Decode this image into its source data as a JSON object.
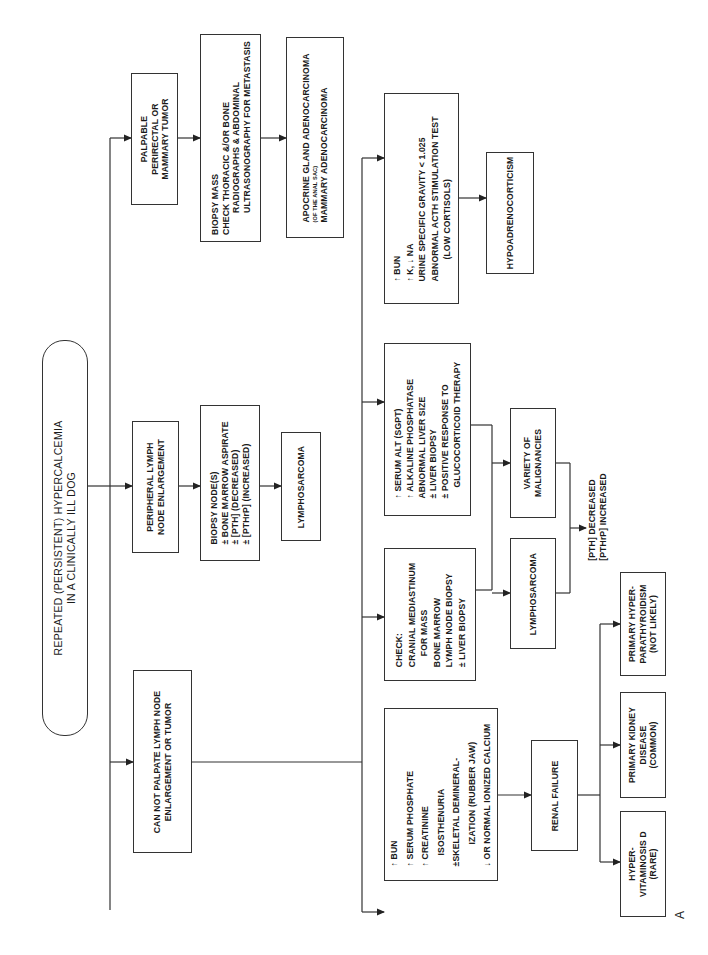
{
  "diagram": {
    "orientation": "rotated 90° counter-clockwise",
    "figure_label": "A",
    "root": {
      "lines": [
        "REPEATED (PERSISTENT) HYPERCALCEMIA",
        "IN A CLINICALLY ILL DOG"
      ]
    },
    "branches": {
      "palpable": {
        "lines": [
          "PALPABLE",
          "PERIRECTAL OR",
          "MAMMARY TUMOR"
        ]
      },
      "biopsy_mass": {
        "lines": [
          "BIOPSY MASS",
          "CHECK THORACIC &/OR BONE",
          "RADIOGRAPHS & ABDOMINAL",
          "ULTRASONOGRAPHY FOR METASTASIS"
        ]
      },
      "apocrine": {
        "line1": "APOCRINE GLAND ADENOCARCINOMA",
        "line2": "(OF THE ANAL SAC)",
        "line3": "MAMMARY ADENOCARCINOMA"
      },
      "peripheral": {
        "lines": [
          "PERIPHERAL LYMPH",
          "NODE ENLARGEMENT"
        ]
      },
      "biopsy_node": {
        "lines": [
          "BIOPSY NODE(S)",
          "± BONE MARROW ASPIRATE",
          "± [PTH] (DECREASED)",
          "± [PTHrP] (INCREASED)"
        ]
      },
      "lymphosarcoma_top": {
        "label": "LYMPHOSARCOMA"
      },
      "cannot_palpate": {
        "lines": [
          "CAN NOT PALPATE LYMPH NODE",
          "ENLARGEMENT OR TUMOR"
        ]
      }
    },
    "sub_branches": {
      "renal_findings": {
        "lines": [
          "↑ BUN",
          "↑ SERUM PHOSPHATE",
          "↑ CREATININE",
          "ISOSTHENURIA",
          "±SKELETAL DEMINERAL-",
          "IZATION (RUBBER JAW)",
          "↓ OR NORMAL IONIZED CALCIUM"
        ]
      },
      "check_mass": {
        "lines": [
          "CHECK:",
          "CRANIAL MEDIASTINUM",
          "FOR MASS",
          "BONE MARROW",
          "LYMPH NODE BIOPSY",
          "± LIVER BIOPSY"
        ]
      },
      "liver_findings": {
        "lines": [
          "↑ SERUM ALT (SGPT)",
          "↑ ALKALINE PHOSPHATASE",
          "ABNORMAL LIVER SIZE",
          "± LIVER BIOPSY",
          "± POSITIVE RESPONSE TO",
          "GLUCOCORTICOID THERAPY"
        ]
      },
      "adrenal_findings": {
        "lines": [
          "↑ BUN",
          "↑ K, ↓ NA",
          "URINE SPECIFIC GRAVITY < 1.025",
          "ABNORMAL ACTH STIMULATION TEST",
          "(LOW CORTISOLS)"
        ]
      }
    },
    "outcomes": {
      "hypoadrenocorticism": {
        "label": "HYPOADRENOCORTICISM"
      },
      "lymphosarcoma_mid": {
        "label": "LYMPHOSARCOMA"
      },
      "variety": {
        "lines": [
          "VARIETY OF",
          "MALIGNANCIES"
        ]
      },
      "pth_note": {
        "lines": [
          "[PTH] DECREASED",
          "[PTHrP] INCREASED"
        ]
      },
      "renal_failure": {
        "label": "RENAL FAILURE"
      },
      "hypervitaminosis": {
        "lines": [
          "HYPER-",
          "VITAMINOSIS D",
          "(RARE)"
        ]
      },
      "kidney_disease": {
        "lines": [
          "PRIMARY KIDNEY",
          "DISEASE",
          "(COMMON)"
        ]
      },
      "hyperparathyroidism": {
        "lines": [
          "PRIMARY HYPER-",
          "PARATHYROIDISM",
          "(NOT LIKELY)"
        ]
      }
    },
    "colors": {
      "line": "#333333",
      "background": "#ffffff",
      "text": "#1a1a1a"
    }
  }
}
